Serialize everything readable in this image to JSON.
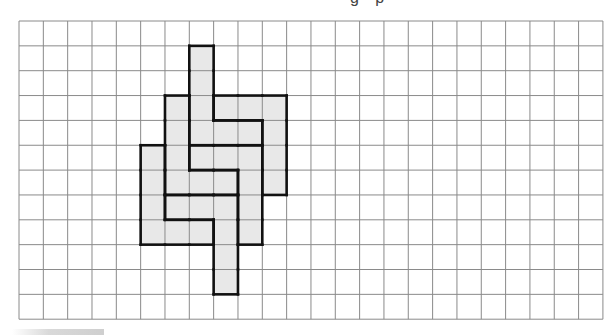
{
  "header": {
    "clipped_title_fragment": "g p"
  },
  "grid": {
    "columns": 24,
    "rows": 12,
    "origin_x": 19,
    "origin_y": 21,
    "cell_width": 24.33,
    "cell_height": 24.85,
    "grid_line_color": "#8a8a8a",
    "piece_outline_color": "#111111",
    "fill_color": "#e8e8e8"
  },
  "pieces": [
    {
      "id": "A",
      "cells": [
        [
          7,
          1
        ],
        [
          7,
          2
        ],
        [
          7,
          3
        ],
        [
          7,
          4
        ],
        [
          8,
          4
        ],
        [
          9,
          4
        ]
      ]
    },
    {
      "id": "B",
      "cells": [
        [
          8,
          3
        ],
        [
          9,
          3
        ],
        [
          10,
          3
        ],
        [
          10,
          4
        ],
        [
          10,
          5
        ],
        [
          10,
          6
        ]
      ]
    },
    {
      "id": "C",
      "cells": [
        [
          7,
          5
        ],
        [
          8,
          5
        ],
        [
          9,
          5
        ],
        [
          9,
          6
        ],
        [
          9,
          7
        ],
        [
          9,
          8
        ]
      ]
    },
    {
      "id": "D",
      "cells": [
        [
          6,
          3
        ],
        [
          6,
          4
        ],
        [
          6,
          5
        ],
        [
          6,
          6
        ],
        [
          7,
          6
        ],
        [
          8,
          6
        ]
      ]
    },
    {
      "id": "E",
      "cells": [
        [
          5,
          5
        ],
        [
          5,
          6
        ],
        [
          5,
          7
        ],
        [
          5,
          8
        ],
        [
          6,
          8
        ],
        [
          7,
          8
        ]
      ]
    },
    {
      "id": "F",
      "cells": [
        [
          6,
          7
        ],
        [
          7,
          7
        ],
        [
          8,
          7
        ],
        [
          8,
          8
        ],
        [
          8,
          9
        ],
        [
          8,
          10
        ]
      ]
    }
  ]
}
